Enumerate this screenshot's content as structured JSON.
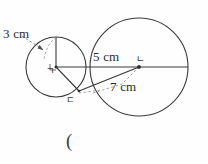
{
  "figure": {
    "type": "geometry-diagram",
    "background_color": "#fefefe",
    "stroke_color": "#3b3b3b",
    "dash_color": "#8d8d8d",
    "text_color": "#2b2b2b",
    "labels": {
      "radius_small": "3 cm",
      "radius_large": "5 cm",
      "segment": "7 cm",
      "point_small_center": "ㄱ",
      "point_large_center": "ㄴ",
      "point_intersection": "ㄷ",
      "answer_paren": "("
    },
    "circles": [
      {
        "name": "small-circle",
        "cx": 56,
        "cy": 67,
        "r": 30,
        "center_label": "ㄱ",
        "radius_label": "3 cm"
      },
      {
        "name": "large-circle",
        "cx": 139,
        "cy": 67,
        "r": 49,
        "center_label": "ㄴ",
        "radius_label": "5 cm"
      }
    ],
    "segments": [
      {
        "name": "horizontal-axis",
        "from": [
          56,
          67
        ],
        "to": [
          188,
          67
        ],
        "style": "solid"
      },
      {
        "name": "small-radius-vertical",
        "from": [
          56,
          67
        ],
        "to": [
          56,
          37
        ],
        "style": "solid"
      },
      {
        "name": "small-center-to-intersection",
        "from": [
          56,
          67
        ],
        "to": [
          79,
          91
        ],
        "style": "solid"
      },
      {
        "name": "intersection-to-large-center",
        "from": [
          79,
          91
        ],
        "to": [
          139,
          67
        ],
        "style": "solid",
        "label": "7 cm"
      },
      {
        "name": "large-center-to-intersection-dashed",
        "from": [
          139,
          67
        ],
        "to": [
          79,
          91
        ],
        "style": "dashed"
      },
      {
        "name": "three-cm-leader",
        "from": [
          24,
          36
        ],
        "to": [
          50,
          50
        ],
        "style": "dashed-arrow"
      }
    ]
  }
}
